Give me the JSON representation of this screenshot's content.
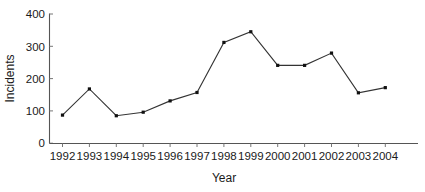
{
  "chart_data": {
    "type": "line",
    "title": "",
    "xlabel": "Year",
    "ylabel": "Incidents",
    "categories": [
      "1992",
      "1993",
      "1994",
      "1995",
      "1996",
      "1997",
      "1998",
      "1999",
      "2000",
      "2001",
      "2002",
      "2003",
      "2004"
    ],
    "values": [
      87,
      168,
      85,
      96,
      131,
      157,
      312,
      345,
      241,
      241,
      279,
      156,
      172
    ],
    "series": [
      {
        "name": "Incidents",
        "values": [
          87,
          168,
          85,
          96,
          131,
          157,
          312,
          345,
          241,
          241,
          279,
          156,
          172
        ]
      }
    ],
    "ylim": [
      0,
      400
    ],
    "yticks": [
      0,
      100,
      200,
      300,
      400
    ],
    "ytick_labels": [
      "0",
      "100",
      "200",
      "300",
      "400"
    ],
    "xtick_labels": [
      "1992",
      "1993",
      "1994",
      "1995",
      "1996",
      "1997",
      "1998",
      "1999",
      "2000",
      "2001",
      "2002",
      "2003",
      "2004"
    ],
    "grid": false,
    "legend": false,
    "legend_position": "none",
    "marker": "filled-square",
    "line_color": "#333333",
    "marker_color": "#111111",
    "axis_color": "#555555",
    "text_color": "#1a1a1a",
    "background_color": "#ffffff"
  },
  "axes": {
    "y_title": "Incidents",
    "x_title": "Year"
  }
}
